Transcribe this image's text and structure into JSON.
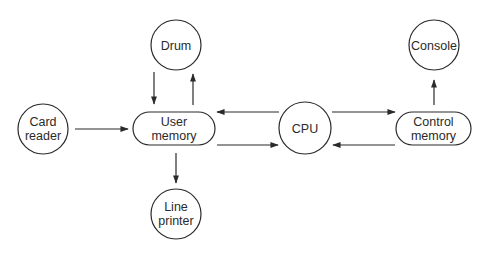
{
  "diagram": {
    "type": "block-diagram",
    "nodes": [
      {
        "id": "drum",
        "shape": "circle",
        "lines": [
          "Drum"
        ],
        "cx": 176,
        "cy": 45,
        "r": 25
      },
      {
        "id": "card_reader",
        "shape": "circle",
        "lines": [
          "Card",
          "reader"
        ],
        "cx": 43,
        "cy": 129,
        "r": 25
      },
      {
        "id": "user_memory",
        "shape": "pill",
        "lines": [
          "User",
          "memory"
        ],
        "x": 133,
        "y": 112,
        "w": 82,
        "h": 33
      },
      {
        "id": "line_printer",
        "shape": "circle",
        "lines": [
          "Line",
          "printer"
        ],
        "cx": 176,
        "cy": 214,
        "r": 25
      },
      {
        "id": "cpu",
        "shape": "circle",
        "lines": [
          "CPU"
        ],
        "cx": 305,
        "cy": 128,
        "r": 26
      },
      {
        "id": "control_memory",
        "shape": "pill",
        "lines": [
          "Control",
          "memory"
        ],
        "x": 396,
        "y": 112,
        "w": 75,
        "h": 33
      },
      {
        "id": "console",
        "shape": "circle",
        "lines": [
          "Console"
        ],
        "cx": 434,
        "cy": 45,
        "r": 25
      }
    ],
    "edges": [
      {
        "from": "drum",
        "to": "user_memory"
      },
      {
        "from": "user_memory",
        "to": "drum"
      },
      {
        "from": "card_reader",
        "to": "user_memory"
      },
      {
        "from": "user_memory",
        "to": "line_printer"
      },
      {
        "from": "cpu",
        "to": "user_memory"
      },
      {
        "from": "user_memory",
        "to": "cpu"
      },
      {
        "from": "cpu",
        "to": "control_memory"
      },
      {
        "from": "control_memory",
        "to": "cpu"
      },
      {
        "from": "control_memory",
        "to": "console"
      }
    ]
  },
  "labels": {
    "drum": [
      "Drum"
    ],
    "card_reader": [
      "Card",
      "reader"
    ],
    "user_memory": [
      "User",
      "memory"
    ],
    "line_printer": [
      "Line",
      "printer"
    ],
    "cpu": [
      "CPU"
    ],
    "control_memory": [
      "Control",
      "memory"
    ],
    "console": [
      "Console"
    ]
  }
}
